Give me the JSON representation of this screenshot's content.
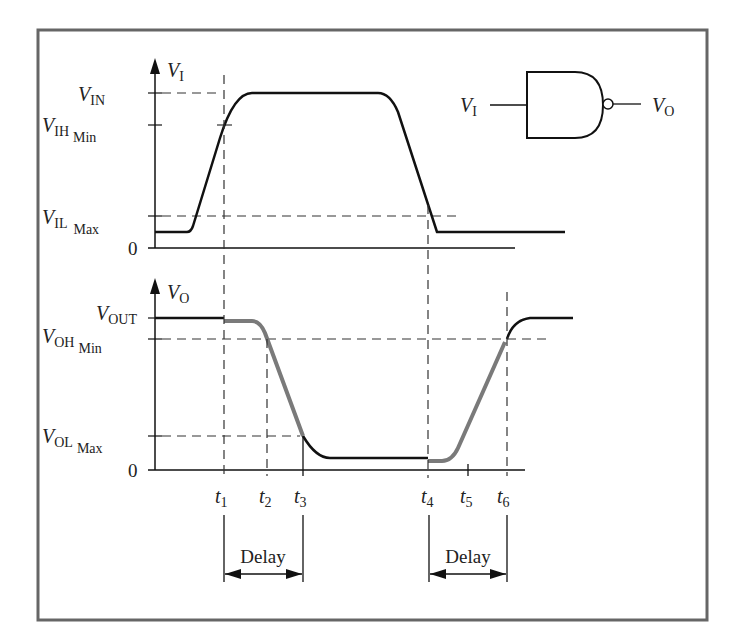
{
  "figure": {
    "type": "timing-diagram"
  },
  "gate": {
    "kind": "NAND",
    "input_label": {
      "main": "V",
      "sub": "I"
    },
    "output_label": {
      "main": "V",
      "sub": "O"
    }
  },
  "input_plot": {
    "axis_label": {
      "main": "V",
      "sub": "I"
    },
    "levels": [
      {
        "id": "vin",
        "main": "V",
        "sub": "IN",
        "sub2": ""
      },
      {
        "id": "vih",
        "main": "V",
        "sub": "IH",
        "sub2": "Min"
      },
      {
        "id": "vil",
        "main": "V",
        "sub": "IL",
        "sub2": "Max"
      }
    ],
    "zero_label": "0"
  },
  "output_plot": {
    "axis_label": {
      "main": "V",
      "sub": "O"
    },
    "levels": [
      {
        "id": "vout",
        "main": "V",
        "sub": "OUT",
        "sub2": ""
      },
      {
        "id": "voh",
        "main": "V",
        "sub": "OH",
        "sub2": "Min"
      },
      {
        "id": "vol",
        "main": "V",
        "sub": "OL",
        "sub2": "Max"
      }
    ],
    "zero_label": "0"
  },
  "time_markers": [
    {
      "main": "t",
      "sub": "1"
    },
    {
      "main": "t",
      "sub": "2"
    },
    {
      "main": "t",
      "sub": "3"
    },
    {
      "main": "t",
      "sub": "4"
    },
    {
      "main": "t",
      "sub": "5"
    },
    {
      "main": "t",
      "sub": "6"
    }
  ],
  "delays": [
    {
      "label": "Delay",
      "from": "t1",
      "to": "t3"
    },
    {
      "label": "Delay",
      "from": "t4",
      "to": "t6"
    }
  ],
  "colors": {
    "line": "#111111",
    "highlight": "#7a7a7a",
    "frame": "#666666",
    "dash": "#333333"
  }
}
